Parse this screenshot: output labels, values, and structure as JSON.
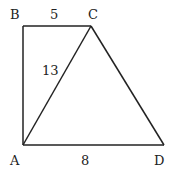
{
  "diagram": {
    "points": {
      "A": {
        "label": "A",
        "x": 23,
        "y": 145
      },
      "B": {
        "label": "B",
        "x": 23,
        "y": 26
      },
      "C": {
        "label": "C",
        "x": 91,
        "y": 26
      },
      "D": {
        "label": "D",
        "x": 164,
        "y": 145
      }
    },
    "segments": [
      {
        "from": "A",
        "to": "B"
      },
      {
        "from": "B",
        "to": "C"
      },
      {
        "from": "C",
        "to": "A"
      },
      {
        "from": "C",
        "to": "D"
      },
      {
        "from": "A",
        "to": "D"
      }
    ],
    "lengths": {
      "BC": "5",
      "AC": "13",
      "AD": "8"
    },
    "line_color": "#222222"
  }
}
